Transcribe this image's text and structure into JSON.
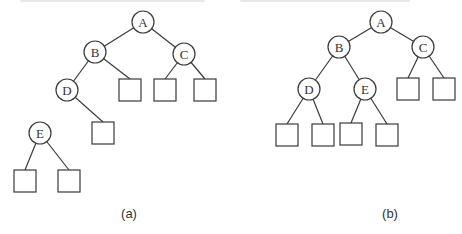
{
  "figure": {
    "title_partial": "",
    "node_radius": 11,
    "leaf_size": 22,
    "colors": {
      "stroke": "#3a3a3a",
      "text": "#333333",
      "background": "#ffffff"
    }
  },
  "trees": [
    {
      "caption": "(a)",
      "caption_pos": [
        129,
        218
      ],
      "nodes": [
        {
          "id": "A",
          "label": "A",
          "x": 143,
          "y": 22
        },
        {
          "id": "B",
          "label": "B",
          "x": 95,
          "y": 52
        },
        {
          "id": "C",
          "label": "C",
          "x": 184,
          "y": 54
        },
        {
          "id": "D",
          "label": "D",
          "x": 67,
          "y": 90
        },
        {
          "id": "E",
          "label": "E",
          "x": 40,
          "y": 133
        }
      ],
      "leaves": [
        {
          "parent": "B",
          "x": 119,
          "y": 79
        },
        {
          "parent": "C",
          "x": 154,
          "y": 79
        },
        {
          "parent": "C",
          "x": 194,
          "y": 79
        },
        {
          "parent": "D",
          "x": 92,
          "y": 122
        },
        {
          "parent": "E",
          "x": 14,
          "y": 170
        },
        {
          "parent": "E",
          "x": 58,
          "y": 170
        }
      ],
      "edges": [
        [
          "A",
          "B"
        ],
        [
          "A",
          "C"
        ],
        [
          "B",
          "D"
        ]
      ]
    },
    {
      "caption": "(b)",
      "caption_pos": [
        390,
        218
      ],
      "nodes": [
        {
          "id": "A",
          "label": "A",
          "x": 381,
          "y": 22
        },
        {
          "id": "B",
          "label": "B",
          "x": 339,
          "y": 47
        },
        {
          "id": "C",
          "label": "C",
          "x": 423,
          "y": 47
        },
        {
          "id": "D",
          "label": "D",
          "x": 309,
          "y": 89
        },
        {
          "id": "E",
          "label": "E",
          "x": 365,
          "y": 89
        }
      ],
      "leaves": [
        {
          "parent": "C",
          "x": 397,
          "y": 78
        },
        {
          "parent": "C",
          "x": 433,
          "y": 78
        },
        {
          "parent": "D",
          "x": 276,
          "y": 124
        },
        {
          "parent": "D",
          "x": 312,
          "y": 124
        },
        {
          "parent": "E",
          "x": 340,
          "y": 123
        },
        {
          "parent": "E",
          "x": 376,
          "y": 124
        }
      ],
      "edges": [
        [
          "A",
          "B"
        ],
        [
          "A",
          "C"
        ],
        [
          "B",
          "D"
        ],
        [
          "B",
          "E"
        ]
      ]
    }
  ]
}
